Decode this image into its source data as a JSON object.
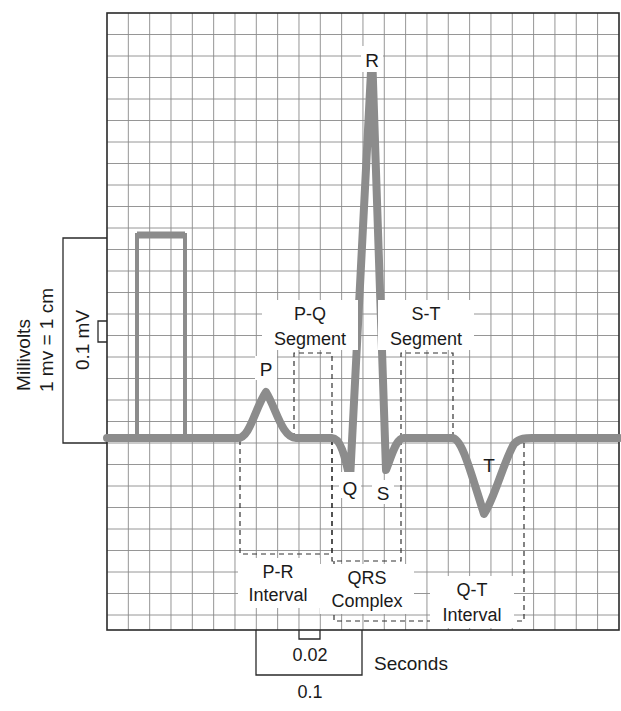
{
  "title": "",
  "colors": {
    "grid_line": "#8a8a8a",
    "grid_border": "#2a2a2a",
    "trace": "#8c8c8c",
    "dashed_box": "#333333",
    "text": "#1a1a1a",
    "background": "#ffffff"
  },
  "waves": {
    "P": "P",
    "Q": "Q",
    "R": "R",
    "S": "S",
    "T": "T"
  },
  "segments": {
    "pq_line1": "P-Q",
    "pq_line2": "Segment",
    "st_line1": "S-T",
    "st_line2": "Segment"
  },
  "intervals": {
    "pr_line1": "P-R",
    "pr_line2": "Interval",
    "qrs_line1": "QRS",
    "qrs_line2": "Complex",
    "qt_line1": "Q-T",
    "qt_line2": "Interval"
  },
  "vertical_scale": {
    "axis_label": "Millivolts",
    "calibration": "1 mv = 1 cm",
    "small_box": "0.1 mV"
  },
  "horizontal_scale": {
    "small_box": "0.02",
    "large_box": "0.1",
    "unit": "Seconds"
  },
  "chart_data": {
    "type": "line",
    "xlabel": "Seconds",
    "ylabel": "Millivolts",
    "grid": true,
    "grid_small_box": {
      "x_seconds": 0.04,
      "y_mV": 0.1
    },
    "scale_annotations": {
      "x": [
        "0.02",
        "0.1"
      ],
      "y": [
        "0.1 mV",
        "1 mv = 1 cm"
      ]
    },
    "calibration_pulse_mV": 1.0,
    "points_mV": [
      {
        "label": "baseline",
        "y": 0.0
      },
      {
        "label": "P",
        "y": 0.23
      },
      {
        "label": "Q",
        "y": -0.34
      },
      {
        "label": "R",
        "y": 1.82
      },
      {
        "label": "S",
        "y": -0.27
      },
      {
        "label": "T",
        "y": -0.36
      }
    ],
    "annotations": [
      "P-Q Segment",
      "S-T Segment",
      "P-R Interval",
      "QRS Complex",
      "Q-T Interval"
    ]
  }
}
